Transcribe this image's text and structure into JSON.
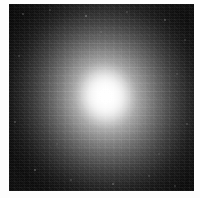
{
  "image": {
    "kind": "astronomical-grayscale-plate",
    "subject": "diffuse elliptical nebulous object with bright saturated core",
    "caption": "",
    "width": 200,
    "height": 198,
    "colorspace": "grayscale",
    "margin_color": "#fdfdfd",
    "plate": {
      "left": 9,
      "top": 4,
      "width": 185,
      "height": 187,
      "background_color": "#060606"
    },
    "core": {
      "center_x": 105,
      "center_y": 96,
      "peak_color": "#ffffff",
      "label": "bright core"
    },
    "halo": {
      "label": "diffuse halo",
      "position_angle_deg": -16,
      "axis_ratio": 0.92,
      "mid_tone_color": "#a8a8a8",
      "outer_tone_color": "#1a1a1a"
    },
    "background_sky": {
      "label": "dark noisy sky background",
      "color": "#0d0d0d",
      "noise": "detector grain and faint speckles"
    }
  },
  "chart_data": {
    "type": "heatmap",
    "title": "",
    "xlabel": "",
    "ylabel": "",
    "legend": [],
    "grid": false,
    "colormap": "grayscale",
    "vmin": 0,
    "vmax": 255,
    "x": [
      -92,
      -69,
      -46,
      -23,
      0,
      23,
      46,
      69,
      92
    ],
    "y": [
      -92,
      -69,
      -46,
      -23,
      0,
      23,
      46,
      69,
      92
    ],
    "radial_profile": {
      "note": "surface brightness (0-255 grey level) versus radius in pixels from core",
      "radius_px": [
        0,
        5,
        10,
        15,
        20,
        25,
        30,
        35,
        40,
        45,
        50,
        55,
        60,
        65,
        70,
        80,
        90
      ],
      "value": [
        255,
        252,
        240,
        222,
        200,
        185,
        168,
        152,
        138,
        168,
        120,
        96,
        76,
        58,
        44,
        26,
        13
      ]
    },
    "values": [
      [
        10,
        12,
        13,
        14,
        15,
        14,
        13,
        11,
        9
      ],
      [
        12,
        16,
        23,
        32,
        38,
        34,
        25,
        16,
        11
      ],
      [
        14,
        24,
        45,
        72,
        86,
        76,
        50,
        27,
        15
      ],
      [
        16,
        33,
        74,
        138,
        178,
        146,
        82,
        37,
        18
      ],
      [
        17,
        38,
        88,
        181,
        255,
        190,
        96,
        42,
        20
      ],
      [
        16,
        35,
        80,
        152,
        192,
        158,
        88,
        38,
        18
      ],
      [
        14,
        27,
        55,
        88,
        104,
        92,
        58,
        28,
        15
      ],
      [
        12,
        18,
        28,
        40,
        46,
        42,
        30,
        19,
        12
      ],
      [
        9,
        12,
        14,
        17,
        19,
        17,
        14,
        12,
        9
      ]
    ]
  }
}
